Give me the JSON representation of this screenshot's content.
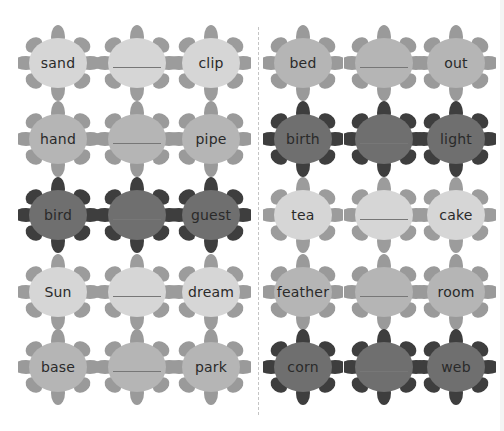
{
  "worksheet": {
    "type": "compound-word flower matching",
    "palette": {
      "light": {
        "center": "#d6d6d6",
        "petal": "#9c9c9c"
      },
      "medium": {
        "center": "#b5b5b5",
        "petal": "#9a9a9a"
      },
      "dark": {
        "center": "#6f6f6f",
        "petal": "#3e3e3e"
      }
    },
    "left_column": [
      {
        "tone": "light",
        "first": "sand",
        "blank": "",
        "second": "clip"
      },
      {
        "tone": "medium",
        "first": "hand",
        "blank": "",
        "second": "pipe"
      },
      {
        "tone": "dark",
        "first": "bird",
        "blank": "",
        "second": "guest"
      },
      {
        "tone": "light",
        "first": "Sun",
        "blank": "",
        "second": "dream"
      },
      {
        "tone": "medium",
        "first": "base",
        "blank": "",
        "second": "park"
      }
    ],
    "right_column": [
      {
        "tone": "medium",
        "first": "bed",
        "blank": "",
        "second": "out"
      },
      {
        "tone": "dark",
        "first": "birth",
        "blank": "",
        "second": "light"
      },
      {
        "tone": "light",
        "first": "tea",
        "blank": "",
        "second": "cake"
      },
      {
        "tone": "medium",
        "first": "feather",
        "blank": "",
        "second": "room"
      },
      {
        "tone": "dark",
        "first": "corn",
        "blank": "",
        "second": "web"
      }
    ]
  }
}
